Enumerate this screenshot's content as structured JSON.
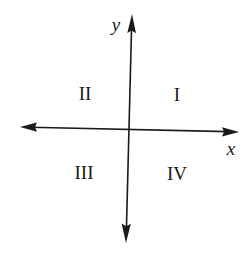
{
  "diagram": {
    "colors": {
      "ink": "#1a1a1a",
      "background": "#ffffff"
    },
    "axes": {
      "x": {
        "label": "x",
        "from": [
          20,
          127
        ],
        "to": [
          238,
          132
        ],
        "arrows": "both"
      },
      "y": {
        "label": "y",
        "from": [
          126,
          242
        ],
        "to": [
          132,
          15
        ],
        "arrows": "both"
      },
      "origin": [
        129,
        129
      ]
    },
    "quadrants": [
      {
        "id": "I",
        "label": "I",
        "position": [
          177,
          95
        ]
      },
      {
        "id": "II",
        "label": "II",
        "position": [
          85,
          93
        ]
      },
      {
        "id": "III",
        "label": "III",
        "position": [
          84,
          172
        ]
      },
      {
        "id": "IV",
        "label": "IV",
        "position": [
          177,
          174
        ]
      }
    ],
    "axis_labels": {
      "x": {
        "text": "x",
        "position": [
          232,
          150
        ]
      },
      "y": {
        "text": "y",
        "position": [
          116,
          25
        ]
      }
    }
  }
}
